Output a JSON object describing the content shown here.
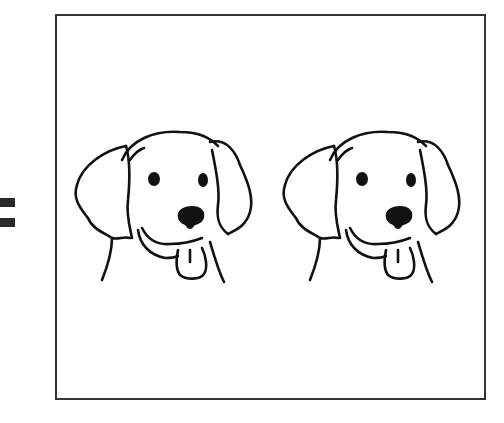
{
  "equation": {
    "operator": "=",
    "operator_name": "equals-sign"
  },
  "frame": {
    "border_color": "#333333",
    "contents": [
      {
        "name": "dog-head",
        "description": "Line drawing of a floppy-eared dog head with tongue out"
      },
      {
        "name": "dog-head",
        "description": "Line drawing of a floppy-eared dog head with tongue out"
      }
    ],
    "count": 2
  },
  "colors": {
    "stroke": "#111111",
    "background": "#ffffff"
  }
}
